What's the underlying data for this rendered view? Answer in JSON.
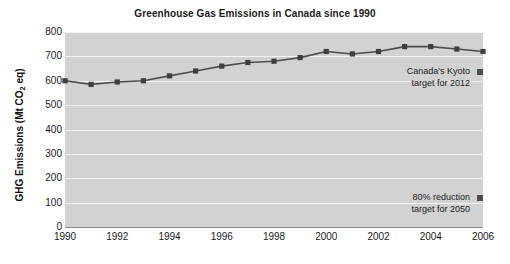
{
  "chart_data": {
    "type": "line",
    "title": "Greenhouse Gas Emissions in Canada since 1990",
    "xlabel": "",
    "ylabel": "GHG Emissions (Mt CO2 eq)",
    "ylabel_parts": {
      "prefix": "GHG Emissions (Mt CO",
      "sub": "2",
      "suffix": " eq)"
    },
    "x": [
      1990,
      1991,
      1992,
      1993,
      1994,
      1995,
      1996,
      1997,
      1998,
      1999,
      2000,
      2001,
      2002,
      2003,
      2004,
      2005,
      2006
    ],
    "values": [
      600,
      585,
      595,
      600,
      620,
      640,
      660,
      675,
      680,
      695,
      720,
      710,
      720,
      740,
      740,
      730,
      720
    ],
    "series": [
      {
        "name": "GHG Emissions",
        "values": [
          600,
          585,
          595,
          600,
          620,
          640,
          660,
          675,
          680,
          695,
          720,
          710,
          720,
          740,
          740,
          730,
          720
        ]
      }
    ],
    "xlim": [
      1990,
      2006
    ],
    "ylim": [
      0,
      800
    ],
    "ytick_labels": [
      "800",
      "700",
      "600",
      "500",
      "400",
      "300",
      "200",
      "100",
      "0"
    ],
    "yticks": [
      800,
      700,
      600,
      500,
      400,
      300,
      200,
      100,
      0
    ],
    "xtick_labels": [
      "1990",
      "1992",
      "1994",
      "1996",
      "1998",
      "2000",
      "2002",
      "2004",
      "2006"
    ],
    "xticks": [
      1990,
      1992,
      1994,
      1996,
      1998,
      2000,
      2002,
      2004,
      2006
    ],
    "grid": true,
    "grid_color": "#f4f4f4",
    "plot_background": "#d2d2d2",
    "line_color": "#4d4d4d",
    "marker_color": "#3f3f3f",
    "legend_position": "none",
    "annotations": [
      {
        "id": "kyoto-target",
        "line1": "Canada's Kyoto",
        "line2": "target for 2012",
        "marker_value": 700,
        "marker_color": "#4d4d4d"
      },
      {
        "id": "reduction-target",
        "line1": "80% reduction",
        "line2": "target for 2050",
        "marker_value": 120,
        "marker_color": "#4d4d4d"
      }
    ]
  }
}
